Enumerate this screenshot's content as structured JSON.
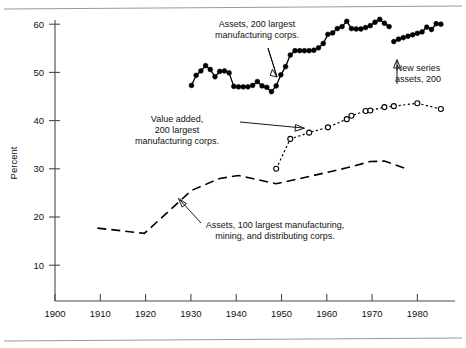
{
  "chart_data": {
    "type": "line",
    "title": "",
    "subtitle": "",
    "xlabel": "",
    "ylabel": "Percent",
    "xlim": [
      1900,
      1985
    ],
    "ylim": [
      0,
      62
    ],
    "grid": false,
    "legend_position": "inline-annotations",
    "xticks": [
      1900,
      1910,
      1920,
      1930,
      1940,
      1950,
      1960,
      1970,
      1980
    ],
    "xtick_labels": [
      "1900",
      "1910",
      "1920",
      "1930",
      "1940",
      "1950",
      "1960",
      "1970",
      "1980"
    ],
    "yticks": [
      10,
      20,
      30,
      40,
      50,
      60
    ],
    "ytick_labels": [
      "10",
      "20",
      "30",
      "40",
      "50",
      "60"
    ],
    "series": [
      {
        "name": "Assets, 200 largest manufacturing corps.",
        "style": "solid-filled-circles",
        "marker": "filled-circle",
        "x": [
          1929,
          1930,
          1931,
          1932,
          1933,
          1934,
          1935,
          1936,
          1937,
          1938,
          1939,
          1940,
          1941,
          1942,
          1943,
          1944,
          1945,
          1946,
          1947,
          1948,
          1949,
          1950,
          1951,
          1952,
          1953,
          1954,
          1955,
          1956,
          1957,
          1958,
          1959,
          1960,
          1961,
          1962,
          1963,
          1964,
          1965,
          1966,
          1967,
          1968,
          1969,
          1970,
          1971
        ],
        "y": [
          47.3,
          49.4,
          50.3,
          51.4,
          50.6,
          49.1,
          50.2,
          50.3,
          49.9,
          47.1,
          47.0,
          47.0,
          47.0,
          47.3,
          48.1,
          47.2,
          46.9,
          46.0,
          47.2,
          49.5,
          51.2,
          53.6,
          54.5,
          54.5,
          54.5,
          54.5,
          54.6,
          55.1,
          56.0,
          57.9,
          58.2,
          59.1,
          59.5,
          60.6,
          59.1,
          59.0,
          59.0,
          59.3,
          59.7,
          60.4,
          61.0,
          60.2,
          59.5
        ]
      },
      {
        "name": "New series assets, 200",
        "style": "solid-filled-circles",
        "marker": "filled-circle",
        "x": [
          1972,
          1973,
          1974,
          1975,
          1976,
          1977,
          1978,
          1979,
          1980,
          1981,
          1982
        ],
        "y": [
          56.4,
          56.9,
          57.2,
          57.5,
          57.8,
          58.1,
          58.4,
          59.4,
          58.9,
          60.1,
          60.0
        ]
      },
      {
        "name": "Value added, 200 largest manufacturing corps.",
        "style": "dotted-open-circles",
        "marker": "open-circle",
        "x": [
          1947,
          1950,
          1954,
          1958,
          1962,
          1963,
          1966,
          1967,
          1970,
          1972,
          1977,
          1982
        ],
        "y": [
          30.0,
          36.2,
          37.5,
          38.6,
          40.3,
          41.0,
          42.0,
          42.1,
          42.8,
          43.0,
          43.6,
          42.4
        ]
      },
      {
        "name": "Assets, 100 largest manufacturing, mining, and distributing corps.",
        "style": "dashed",
        "marker": "none",
        "x": [
          1909,
          1919,
          1929,
          1935,
          1939,
          1947,
          1954,
          1958,
          1962,
          1967,
          1970,
          1975
        ],
        "y": [
          17.7,
          16.6,
          25.5,
          28.0,
          28.6,
          26.9,
          28.4,
          29.3,
          30.2,
          31.5,
          31.6,
          29.9
        ]
      }
    ],
    "annotations": [
      {
        "id": "anno-assets-200",
        "lines": [
          "Assets, 200 largest",
          "manufacturing corps."
        ],
        "target_series": "Assets, 200 largest manufacturing corps."
      },
      {
        "id": "anno-new-series",
        "lines": [
          "New series",
          "assets, 200"
        ],
        "target_series": "New series assets, 200"
      },
      {
        "id": "anno-value-added",
        "lines": [
          "Value added,",
          "200 largest",
          "manufacturing corps."
        ],
        "target_series": "Value added, 200 largest manufacturing corps."
      },
      {
        "id": "anno-assets-100",
        "lines": [
          "Assets, 100 largest manufacturing,",
          "mining, and distributing corps."
        ],
        "target_series": "Assets, 100 largest manufacturing, mining, and distributing corps."
      }
    ],
    "colors": {
      "ink": "#000000",
      "axis": "#4a4a4a",
      "frame": "#9a9a9a",
      "background": "#ffffff"
    }
  }
}
